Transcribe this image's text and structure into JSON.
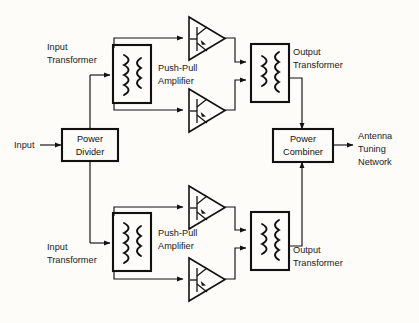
{
  "diagram": {
    "background_color": "#fdfcf8",
    "line_color": "#111111",
    "labels": {
      "input": "Input",
      "power_divider_line1": "Power",
      "power_divider_line2": "Divider",
      "input_transformer_top_line1": "Input",
      "input_transformer_top_line2": "Transformer",
      "input_transformer_bottom_line1": "Input",
      "input_transformer_bottom_line2": "Transformer",
      "push_pull_top_line1": "Push-Pull",
      "push_pull_top_line2": "Amplifier",
      "push_pull_bottom_line1": "Push-Pull",
      "push_pull_bottom_line2": "Amplifier",
      "output_transformer_top_line1": "Output",
      "output_transformer_top_line2": "Transformer",
      "output_transformer_bottom_line1": "Output",
      "output_transformer_bottom_line2": "Transformer",
      "power_combiner_line1": "Power",
      "power_combiner_line2": "Combiner",
      "antenna_line1": "Antenna",
      "antenna_line2": "Tuning",
      "antenna_line3": "Network"
    },
    "blocks": [
      {
        "name": "power-divider",
        "type": "rect",
        "label": "Power Divider"
      },
      {
        "name": "input-transformer-top",
        "type": "transformer",
        "label": "Input Transformer"
      },
      {
        "name": "input-transformer-bottom",
        "type": "transformer",
        "label": "Input Transformer"
      },
      {
        "name": "amplifier-top-upper",
        "type": "triangle",
        "label": "Push-Pull Amplifier"
      },
      {
        "name": "amplifier-top-lower",
        "type": "triangle",
        "label": "Push-Pull Amplifier"
      },
      {
        "name": "amplifier-bottom-upper",
        "type": "triangle",
        "label": "Push-Pull Amplifier"
      },
      {
        "name": "amplifier-bottom-lower",
        "type": "triangle",
        "label": "Push-Pull Amplifier"
      },
      {
        "name": "output-transformer-top",
        "type": "transformer",
        "label": "Output Transformer"
      },
      {
        "name": "output-transformer-bottom",
        "type": "transformer",
        "label": "Output Transformer"
      },
      {
        "name": "power-combiner",
        "type": "rect",
        "label": "Power Combiner"
      }
    ],
    "signal_flow": [
      "Input → Power Divider",
      "Power Divider → Input Transformer (top)",
      "Power Divider → Input Transformer (bottom)",
      "Input Transformer → Push-Pull Amplifier (2 devices)",
      "Push-Pull Amplifier → Output Transformer",
      "Output Transformer (top) → Power Combiner",
      "Output Transformer (bottom) → Power Combiner",
      "Power Combiner → Antenna Tuning Network"
    ]
  }
}
